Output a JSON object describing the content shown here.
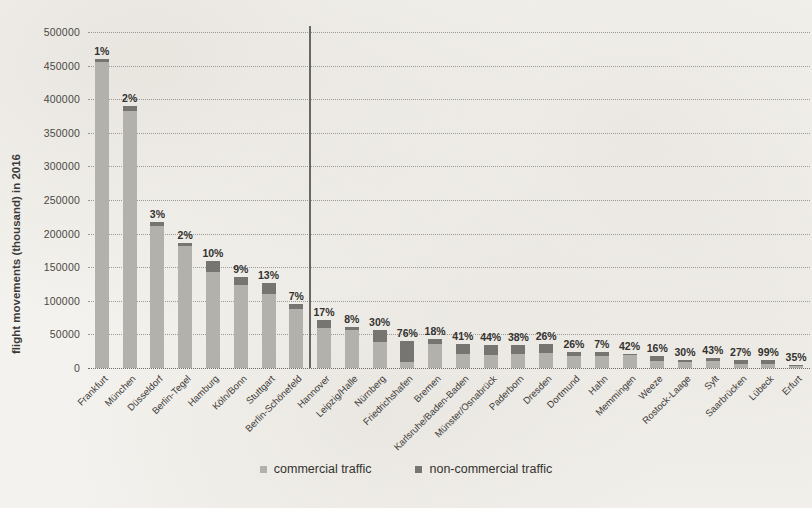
{
  "chart_data": {
    "type": "bar",
    "subtype": "stacked-bar",
    "title": "",
    "xlabel": "",
    "ylabel": "flight movements (thousand) in 2016",
    "ylim": [
      0,
      500000
    ],
    "ytick_step": 50000,
    "yticks": [
      "0",
      "50000",
      "100000",
      "150000",
      "200000",
      "250000",
      "300000",
      "350000",
      "400000",
      "450000",
      "500000"
    ],
    "grid": true,
    "legend_position": "bottom-center",
    "series": [
      {
        "name": "commercial traffic",
        "color": "#b3b1ac",
        "values": [
          455000,
          382000,
          211000,
          182000,
          143000,
          124000,
          110000,
          88000,
          60000,
          56000,
          39000,
          9600,
          35000,
          21000,
          19000,
          21000,
          22000,
          18000,
          18000,
          19000,
          10000,
          9000,
          10000,
          6500,
          6000,
          2500
        ]
      },
      {
        "name": "non-commercial traffic",
        "color": "#767571",
        "values": [
          5000,
          8000,
          6500,
          3500,
          16000,
          12000,
          16000,
          7000,
          12000,
          5000,
          17000,
          30400,
          7700,
          14600,
          15000,
          12900,
          13500,
          6300,
          6300,
          1400,
          7200,
          1700,
          4300,
          4800,
          5900,
          1300
        ]
      }
    ],
    "categories": [
      "Frankfurt",
      "München",
      "Düsseldorf",
      "Berlin-Tegel",
      "Hamburg",
      "Köln/Bonn",
      "Stuttgart",
      "Berlin-Schönefeld",
      "Hannover",
      "Leipzig/Halle",
      "Nürnberg",
      "Friedrichshafen",
      "Bremen",
      "Karlsruhe/Baden-Baden",
      "Münster/Osnabrück",
      "Paderborn",
      "Dresden",
      "Dortmund",
      "Hahn",
      "Memmingen",
      "Weeze",
      "Rostock-Laage",
      "Sylt",
      "Saarbrücken",
      "Lübeck",
      "Erfurt"
    ],
    "point_labels": [
      "1%",
      "2%",
      "3%",
      "2%",
      "10%",
      "9%",
      "13%",
      "7%",
      "17%",
      "8%",
      "30%",
      "76%",
      "18%",
      "41%",
      "44%",
      "38%",
      "26%",
      "26%",
      "7%",
      "42%",
      "16%",
      "30%",
      "43%",
      "27%",
      "99%",
      "35%"
    ],
    "annotations": [
      {
        "name": "category-divider",
        "after_category": "Berlin-Schönefeld",
        "type": "vertical-line",
        "color": "#6a6862"
      }
    ]
  },
  "legend": {
    "items": [
      {
        "label": "commercial traffic",
        "swatch": "square-light-gray"
      },
      {
        "label": "non-commercial traffic",
        "swatch": "square-dark-gray"
      }
    ]
  }
}
